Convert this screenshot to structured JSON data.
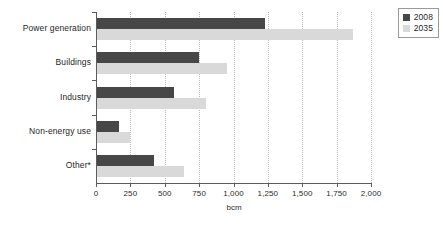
{
  "chart_data": {
    "type": "bar",
    "orientation": "horizontal",
    "title": "",
    "xlabel": "bcm",
    "ylabel": "",
    "xlim": [
      0,
      2000
    ],
    "xticks": [
      0,
      250,
      500,
      750,
      1000,
      1250,
      1500,
      1750,
      2000
    ],
    "xtick_labels": [
      "0",
      "250",
      "500",
      "750",
      "1,000",
      "1,250",
      "1,500",
      "1,750",
      "2,000"
    ],
    "grid": true,
    "grid_axis": "x",
    "legend_position": "top-right",
    "categories": [
      "Power generation",
      "Buildings",
      "Industry",
      "Non-energy use",
      "Other*"
    ],
    "series": [
      {
        "name": "2008",
        "color": "#474747",
        "values": [
          1230,
          750,
          570,
          170,
          420
        ]
      },
      {
        "name": "2035",
        "color": "#d9d9d9",
        "values": [
          1870,
          950,
          800,
          250,
          640
        ]
      }
    ]
  },
  "legend": {
    "entries": [
      {
        "label": "2008",
        "color": "#474747"
      },
      {
        "label": "2035",
        "color": "#d9d9d9"
      }
    ]
  },
  "axis": {
    "x_title": "bcm"
  },
  "colors": {
    "series_2008": "#474747",
    "series_2035": "#d9d9d9",
    "axis": "#5c5c5c",
    "gridline": "#b9b9b9",
    "text": "#1f1f1f",
    "background": "#ffffff"
  }
}
